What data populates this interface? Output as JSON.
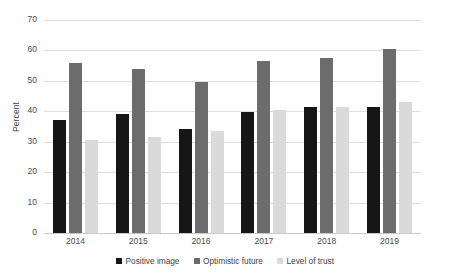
{
  "chart_data": {
    "type": "bar",
    "title": "",
    "subtitle": "",
    "xlabel": "",
    "ylabel": "Percent",
    "ylim": [
      0,
      70
    ],
    "yticks": [
      0,
      10,
      20,
      30,
      40,
      50,
      60,
      70
    ],
    "grid": true,
    "legend_position": "bottom",
    "categories": [
      "2014",
      "2015",
      "2016",
      "2017",
      "2018",
      "2019"
    ],
    "series": [
      {
        "name": "Positive image",
        "color": "#161616",
        "values": [
          37.0,
          39.0,
          34.3,
          39.7,
          41.3,
          41.5
        ]
      },
      {
        "name": "Optimistic future",
        "color": "#6c6c6c",
        "values": [
          56.0,
          53.8,
          49.6,
          56.6,
          57.5,
          60.5
        ]
      },
      {
        "name": "Level of trust",
        "color": "#dadada",
        "values": [
          30.7,
          31.5,
          33.4,
          40.5,
          41.3,
          43.1
        ]
      }
    ]
  }
}
